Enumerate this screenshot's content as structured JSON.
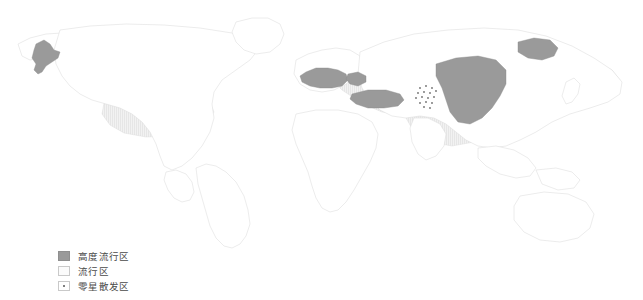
{
  "figure": {
    "type": "choropleth-world-map",
    "background_color": "#ffffff",
    "land_fill": "#ffffff",
    "border_color": "#dcdcdc",
    "width": 643,
    "height": 300
  },
  "legend": {
    "items": [
      {
        "id": "high-endemic",
        "label": "高度流行区",
        "swatch": "filled-dark-gray",
        "color": "#9a9a9a"
      },
      {
        "id": "endemic",
        "label": "流行区",
        "swatch": "light-hatched",
        "color": "#ededed"
      },
      {
        "id": "sporadic",
        "label": "零星散发区",
        "swatch": "white-with-dot",
        "color": "#ffffff",
        "dot_color": "#555555"
      }
    ]
  },
  "map_data": {
    "type": "categorical-area",
    "categories": [
      "高度流行区",
      "流行区",
      "零星散发区"
    ],
    "regions": [
      {
        "name": "alaska-western",
        "category": "高度流行区",
        "continent": "North America"
      },
      {
        "name": "central-north-america-plains",
        "category": "流行区",
        "continent": "North America"
      },
      {
        "name": "central-europe-alpine",
        "category": "高度流行区",
        "continent": "Europe"
      },
      {
        "name": "balkans",
        "category": "高度流行区",
        "continent": "Europe"
      },
      {
        "name": "anatolia-turkey",
        "category": "高度流行区",
        "continent": "Asia"
      },
      {
        "name": "mongolia-northwest-china",
        "category": "高度流行区",
        "continent": "Asia"
      },
      {
        "name": "northeast-siberia-patch",
        "category": "高度流行区",
        "continent": "Asia"
      },
      {
        "name": "eurasian-belt-russia-kazakhstan",
        "category": "流行区",
        "continent": "Eurasia"
      },
      {
        "name": "central-asia-tien-shan",
        "category": "零星散发区",
        "continent": "Asia"
      }
    ],
    "unshaded_continents": [
      "Africa",
      "South America",
      "Australia",
      "Southeast Asia"
    ]
  }
}
